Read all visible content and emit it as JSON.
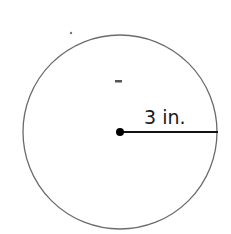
{
  "diagram": {
    "shape": "circle",
    "radius_label": "3 in.",
    "colors": {
      "outline": "#6b6b6b",
      "radius_line": "#111111",
      "center_dot": "#000000"
    }
  }
}
